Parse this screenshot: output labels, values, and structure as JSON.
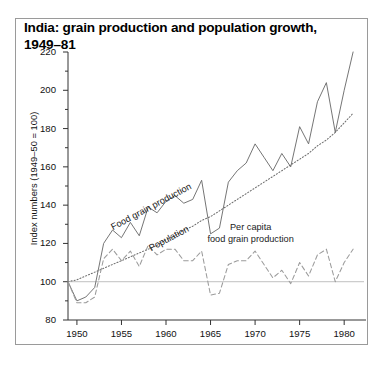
{
  "figure": {
    "title": "India: grain production and population growth, 1949–81",
    "frame_color": "#9a9a9a",
    "background": "#ffffff"
  },
  "chart_data": {
    "type": "line",
    "title": "India: grain production and population growth, 1949–81",
    "xlabel": "",
    "ylabel": "Index numbers (1949–50 = 100)",
    "xlim": [
      1949,
      1982
    ],
    "ylim": [
      80,
      220
    ],
    "ytick_labels": [
      "80",
      "100",
      "120",
      "140",
      "160",
      "180",
      "200",
      "220"
    ],
    "ytick_values": [
      80,
      100,
      120,
      140,
      160,
      180,
      200,
      220
    ],
    "yminor_step": 10,
    "xtick_labels": [
      "1950",
      "1955",
      "1960",
      "1965",
      "1970",
      "1975",
      "1980"
    ],
    "xtick_values": [
      1950,
      1955,
      1960,
      1965,
      1970,
      1975,
      1980
    ],
    "grid": false,
    "reference_line": {
      "value": 100,
      "color": "#c0c0c0"
    },
    "legend": "inline-annotations",
    "annotations": [
      {
        "text": "Food grain production",
        "x": 1954.2,
        "y": 131,
        "rotation": -28
      },
      {
        "text": "Population",
        "x": 1958.4,
        "y": 120,
        "rotation": -28
      },
      {
        "text": "Per capita\nfood grain production",
        "x": 1969.5,
        "y": 127,
        "rotation": 0
      }
    ],
    "x": [
      1949,
      1950,
      1951,
      1952,
      1953,
      1954,
      1955,
      1956,
      1957,
      1958,
      1959,
      1960,
      1961,
      1962,
      1963,
      1964,
      1965,
      1966,
      1967,
      1968,
      1969,
      1970,
      1971,
      1972,
      1973,
      1974,
      1975,
      1976,
      1977,
      1978,
      1979,
      1980,
      1981
    ],
    "series": [
      {
        "name": "Food grain production",
        "style": "solid",
        "color": "#6e6e6e",
        "values": [
          100,
          90,
          92,
          97,
          120,
          127,
          123,
          131,
          124,
          139,
          136,
          142,
          145,
          141,
          143,
          153,
          125,
          128,
          152,
          158,
          162,
          172,
          165,
          158,
          167,
          160,
          181,
          172,
          194,
          204,
          178,
          200,
          220
        ]
      },
      {
        "name": "Population",
        "style": "dotted",
        "color": "#6e6e6e",
        "values": [
          100,
          101,
          103,
          105,
          107,
          109,
          111,
          113,
          115,
          117,
          119,
          122,
          124,
          127,
          129,
          132,
          134,
          137,
          140,
          143,
          146,
          149,
          152,
          155,
          158,
          161,
          164,
          167,
          171,
          174,
          178,
          183,
          188
        ]
      },
      {
        "name": "Per capita food grain production",
        "style": "dashed",
        "color": "#9b9b9b",
        "values": [
          100,
          89,
          89,
          92,
          112,
          117,
          111,
          116,
          108,
          119,
          114,
          117,
          117,
          111,
          111,
          116,
          93,
          94,
          109,
          111,
          111,
          116,
          109,
          102,
          106,
          99,
          110,
          103,
          114,
          117,
          100,
          110,
          117
        ]
      }
    ]
  },
  "axis": {
    "y_label_text": "Index numbers (1949–50 = 100)"
  }
}
